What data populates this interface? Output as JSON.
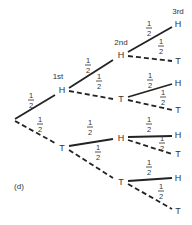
{
  "figure_label": "(d)",
  "level_labels": [
    "1st",
    "2nd",
    "3rd"
  ],
  "probability": {
    "num": "1",
    "den": "2"
  },
  "legend_style": {
    "heads_line": "solid",
    "tails_line": "dashed"
  },
  "nodes": {
    "root": {
      "x": 15,
      "y": 120
    },
    "H": {
      "label": "H",
      "x": 62,
      "y": 90
    },
    "T": {
      "label": "T",
      "x": 62,
      "y": 148
    },
    "HH": {
      "label": "H",
      "x": 121,
      "y": 55
    },
    "HT": {
      "label": "T",
      "x": 121,
      "y": 99
    },
    "TH": {
      "label": "H",
      "x": 121,
      "y": 138
    },
    "TT": {
      "label": "T",
      "x": 121,
      "y": 182
    },
    "HHH": {
      "label": "H",
      "x": 178,
      "y": 24
    },
    "HHT": {
      "label": "T",
      "x": 178,
      "y": 61
    },
    "HTH": {
      "label": "H",
      "x": 178,
      "y": 83
    },
    "HTT": {
      "label": "T",
      "x": 178,
      "y": 110
    },
    "THH": {
      "label": "H",
      "x": 178,
      "y": 135
    },
    "THT": {
      "label": "T",
      "x": 178,
      "y": 154
    },
    "TTH": {
      "label": "H",
      "x": 178,
      "y": 178
    },
    "TTT": {
      "label": "T",
      "x": 178,
      "y": 211
    }
  }
}
